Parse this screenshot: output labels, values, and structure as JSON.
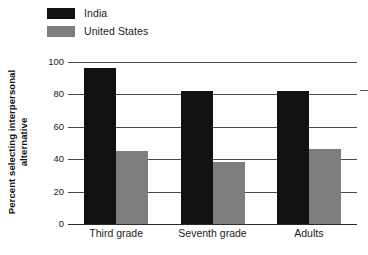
{
  "chart_data": {
    "type": "bar",
    "title": "",
    "subtitle": "",
    "xlabel": "",
    "ylabel": "Percent selecting interpersonal alternative",
    "ylabel_lines": [
      "Percent selecting interpersonal",
      "alternative"
    ],
    "categories": [
      "Third grade",
      "Seventh grade",
      "Adults"
    ],
    "series": [
      {
        "name": "India",
        "color": "#111111",
        "values": [
          96,
          82,
          82
        ]
      },
      {
        "name": "United States",
        "color": "#7d7d7d",
        "values": [
          45,
          38,
          46
        ]
      }
    ],
    "ylim": [
      0,
      100
    ],
    "yticks": [
      0,
      20,
      40,
      60,
      80,
      100
    ],
    "ytick_labels": [
      "0",
      "20",
      "40",
      "60",
      "80",
      "100"
    ],
    "grid": true,
    "grid_axis": "y",
    "legend": {
      "position": "top-left",
      "entries": [
        {
          "label": "India",
          "color": "#111111"
        },
        {
          "label": "United States",
          "color": "#7d7d7d"
        }
      ]
    },
    "annotations": []
  }
}
